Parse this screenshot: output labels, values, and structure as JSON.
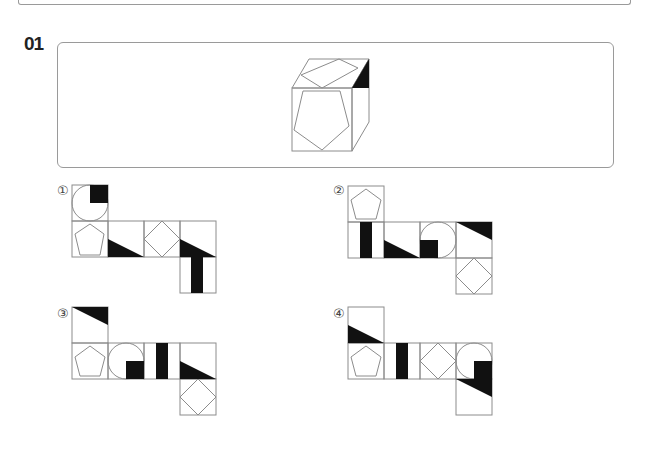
{
  "question": {
    "number": "01",
    "prompt_figure": "cube-with-pentagon-front-rhombus-top-black-triangle-corner"
  },
  "options": [
    {
      "label": "①",
      "id": 1
    },
    {
      "label": "②",
      "id": 2
    },
    {
      "label": "③",
      "id": 3
    },
    {
      "label": "④",
      "id": 4
    }
  ],
  "colors": {
    "line": "#8c8c8c",
    "fill": "#111111",
    "border": "#9a9a9a"
  }
}
